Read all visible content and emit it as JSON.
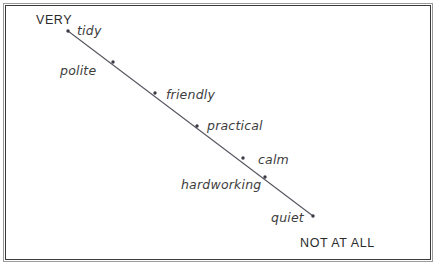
{
  "figure": {
    "background_color": "#ffffff",
    "frame_color_outer": "#9a9a9a",
    "frame_color_inner": "#3a3a3a",
    "line_color": "#55555f",
    "marker_color": "#3a3a45",
    "text_color": "#3d3d3d",
    "anchor_text_color": "#2b2b2b"
  },
  "scale": {
    "high_anchor": "VERY",
    "low_anchor": "NOT AT ALL"
  },
  "chart_data": {
    "type": "scatter",
    "title": "",
    "xlabel": "",
    "ylabel": "",
    "grid": false,
    "legend": null,
    "annotations": [
      "VERY",
      "NOT AT ALL"
    ],
    "line": {
      "start": [
        68,
        31
      ],
      "end": [
        313,
        216
      ]
    },
    "categories": [
      "tidy",
      "polite",
      "friendly",
      "practical",
      "calm",
      "hardworking",
      "quiet"
    ],
    "points": [
      {
        "label": "tidy",
        "rank": 1,
        "marker_x": 68,
        "marker_y": 31,
        "label_x": 77,
        "label_y": 23
      },
      {
        "label": "polite",
        "rank": 2,
        "marker_x": 113,
        "marker_y": 62,
        "label_x": 60,
        "label_y": 63
      },
      {
        "label": "friendly",
        "rank": 3,
        "marker_x": 155,
        "marker_y": 93,
        "label_x": 166,
        "label_y": 87
      },
      {
        "label": "practical",
        "rank": 4,
        "marker_x": 197,
        "marker_y": 126,
        "label_x": 207,
        "label_y": 118
      },
      {
        "label": "calm",
        "rank": 5,
        "marker_x": 243,
        "marker_y": 158,
        "label_x": 258,
        "label_y": 152
      },
      {
        "label": "hardworking",
        "rank": 6,
        "marker_x": 265,
        "marker_y": 177,
        "label_x": 181,
        "label_y": 177
      },
      {
        "label": "quiet",
        "rank": 7,
        "marker_x": 313,
        "marker_y": 216,
        "label_x": 271,
        "label_y": 210
      }
    ]
  }
}
